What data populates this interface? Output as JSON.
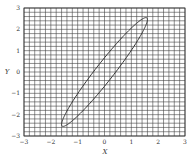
{
  "chart_data": {
    "type": "line",
    "title": "",
    "xlabel": "X",
    "ylabel": "Y",
    "xlim": [
      -3,
      3
    ],
    "ylim": [
      -3,
      3
    ],
    "x_ticks": [
      "-3",
      "-2",
      "-1",
      "0",
      "1",
      "2",
      "3"
    ],
    "y_ticks": [
      "-3",
      "-2",
      "-1",
      "0",
      "1",
      "2",
      "3"
    ],
    "grid": true,
    "grid_step": 0.2,
    "series": [
      {
        "name": "confidence ellipse",
        "shape": "ellipse",
        "center": [
          0,
          0
        ],
        "extent_x": [
          -1.6,
          1.6
        ],
        "extent_y": [
          -2.55,
          2.55
        ],
        "endpoints": [
          [
            -1.6,
            -2.5
          ],
          [
            1.6,
            2.5
          ]
        ],
        "color": "#333333"
      }
    ],
    "legend": null
  },
  "colors": {
    "grid": "#444444",
    "curve": "#333333",
    "background": "#ffffff"
  }
}
